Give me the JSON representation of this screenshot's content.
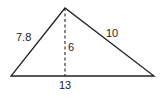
{
  "diagram": {
    "type": "triangle",
    "vertices": {
      "apex": [
        65,
        8
      ],
      "bottom_left": [
        11,
        76
      ],
      "bottom_right": [
        154,
        76
      ]
    },
    "labels": {
      "left_side": "7.8",
      "right_side": "10",
      "height": "6",
      "base": "13"
    },
    "colors": {
      "stroke": "#222222",
      "background": "#ffffff"
    }
  }
}
